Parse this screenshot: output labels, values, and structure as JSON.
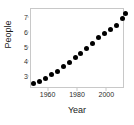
{
  "chart_data": {
    "type": "scatter",
    "title": "",
    "xlabel": "Year",
    "ylabel": "People",
    "xlim": [
      1948,
      2012
    ],
    "ylim": [
      2.2,
      7.6
    ],
    "xticks": [
      1960,
      1980,
      2000
    ],
    "xtick_labels": [
      "1960",
      "1980",
      "2000"
    ],
    "yticks": [
      3,
      4,
      5,
      6,
      7
    ],
    "ytick_labels": [
      "3",
      "4",
      "5",
      "6",
      "7"
    ],
    "grid": false,
    "legend": null,
    "marker": {
      "shape": "circle",
      "color": "#000000",
      "size": 5
    },
    "x": [
      1950,
      1954,
      1958,
      1962,
      1966,
      1970,
      1974,
      1978,
      1982,
      1986,
      1990,
      1994,
      1998,
      2002,
      2006,
      2010,
      2012
    ],
    "y": [
      2.54,
      2.73,
      2.94,
      3.15,
      3.4,
      3.7,
      4.0,
      4.3,
      4.6,
      4.95,
      5.3,
      5.65,
      5.95,
      6.25,
      6.5,
      6.95,
      7.3
    ],
    "series": [
      {
        "name": "People",
        "x": [
          1950,
          1954,
          1958,
          1962,
          1966,
          1970,
          1974,
          1978,
          1982,
          1986,
          1990,
          1994,
          1998,
          2002,
          2006,
          2010,
          2012
        ],
        "values": [
          2.54,
          2.73,
          2.94,
          3.15,
          3.4,
          3.7,
          4.0,
          4.3,
          4.6,
          4.95,
          5.3,
          5.65,
          5.95,
          6.25,
          6.5,
          6.95,
          7.3
        ]
      }
    ]
  },
  "axes": {
    "frame_color": "#c8c8c8",
    "tick_color": "#c8c8c8",
    "label_color": "#1a1a1a",
    "tick_label_color": "#2b2b2b"
  }
}
